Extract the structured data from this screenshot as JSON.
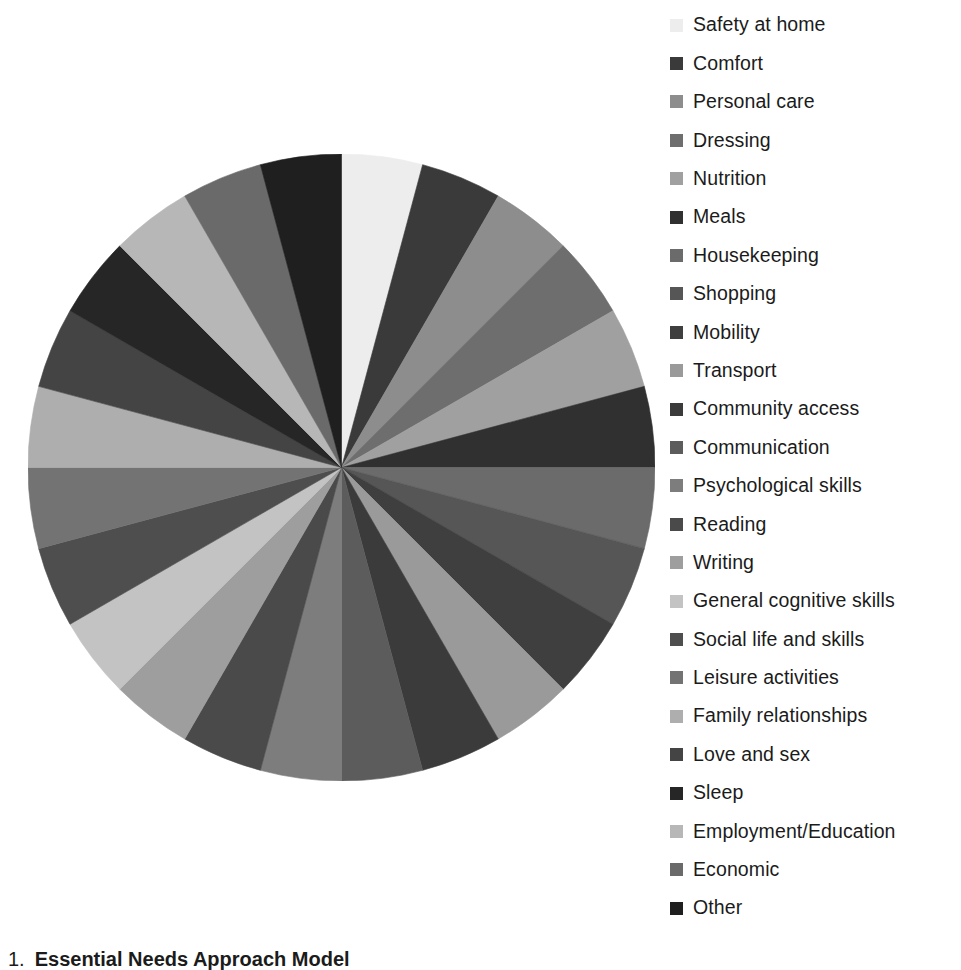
{
  "chart_data": {
    "type": "pie",
    "title": "",
    "legend_position": "right",
    "start_angle_deg": 0,
    "direction": "clockwise",
    "categories": [
      "Safety at home",
      "Comfort",
      "Personal care",
      "Dressing",
      "Nutrition",
      "Meals",
      "Housekeeping",
      "Shopping",
      "Mobility",
      "Transport",
      "Community access",
      "Communication",
      "Psychological skills",
      "Reading",
      "Writing",
      "General cognitive skills",
      "Social life and skills",
      "Leisure activities",
      "Family relationships",
      "Love and sex",
      "Sleep",
      "Employment/Education",
      "Economic",
      "Other"
    ],
    "values": [
      1,
      1,
      1,
      1,
      1,
      1,
      1,
      1,
      1,
      1,
      1,
      1,
      1,
      1,
      1,
      1,
      1,
      1,
      1,
      1,
      1,
      1,
      1,
      1
    ],
    "colors": [
      "#ededed",
      "#3a3a3a",
      "#8d8d8d",
      "#6e6e6e",
      "#a0a0a0",
      "#303030",
      "#6b6b6b",
      "#565656",
      "#3f3f3f",
      "#9a9a9a",
      "#3b3b3b",
      "#5c5c5c",
      "#7d7d7d",
      "#4a4a4a",
      "#9e9e9e",
      "#c3c3c3",
      "#4e4e4e",
      "#737373",
      "#aeaeae",
      "#444444",
      "#262626",
      "#b7b7b7",
      "#6a6a6a",
      "#1f1f1f"
    ]
  },
  "legend": {
    "items": [
      {
        "label": "Safety at home",
        "color": "#ededed"
      },
      {
        "label": "Comfort",
        "color": "#3a3a3a"
      },
      {
        "label": "Personal care",
        "color": "#8d8d8d"
      },
      {
        "label": "Dressing",
        "color": "#6e6e6e"
      },
      {
        "label": "Nutrition",
        "color": "#a0a0a0"
      },
      {
        "label": "Meals",
        "color": "#303030"
      },
      {
        "label": "Housekeeping",
        "color": "#6b6b6b"
      },
      {
        "label": "Shopping",
        "color": "#565656"
      },
      {
        "label": "Mobility",
        "color": "#3f3f3f"
      },
      {
        "label": "Transport",
        "color": "#9a9a9a"
      },
      {
        "label": "Community access",
        "color": "#3b3b3b"
      },
      {
        "label": "Communication",
        "color": "#5c5c5c"
      },
      {
        "label": "Psychological skills",
        "color": "#7d7d7d"
      },
      {
        "label": "Reading",
        "color": "#4a4a4a"
      },
      {
        "label": "Writing",
        "color": "#9e9e9e"
      },
      {
        "label": "General cognitive skills",
        "color": "#c3c3c3"
      },
      {
        "label": "Social life and skills",
        "color": "#4e4e4e"
      },
      {
        "label": "Leisure activities",
        "color": "#737373"
      },
      {
        "label": "Family relationships",
        "color": "#aeaeae"
      },
      {
        "label": "Love and sex",
        "color": "#444444"
      },
      {
        "label": "Sleep",
        "color": "#262626"
      },
      {
        "label": "Employment/Education",
        "color": "#b7b7b7"
      },
      {
        "label": "Economic",
        "color": "#6a6a6a"
      },
      {
        "label": "Other",
        "color": "#1f1f1f"
      }
    ]
  },
  "caption": {
    "index": "1.",
    "title": "Essential Needs Approach Model"
  }
}
